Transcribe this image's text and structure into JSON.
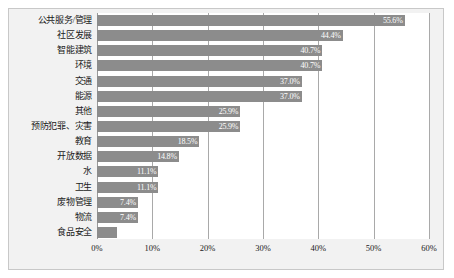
{
  "chart_data": {
    "type": "bar",
    "orientation": "horizontal",
    "title": "",
    "xlabel": "",
    "ylabel": "",
    "xlim": [
      0,
      60
    ],
    "grid": true,
    "legend": false,
    "x_ticks": [
      "0%",
      "10%",
      "20%",
      "30%",
      "40%",
      "50%",
      "60%"
    ],
    "x_tick_values": [
      0,
      10,
      20,
      30,
      40,
      50,
      60
    ],
    "categories": [
      "公共服务/管理",
      "社区发展",
      "智能建筑",
      "环境",
      "交通",
      "能源",
      "其他",
      "预防犯罪、灾害",
      "教育",
      "开放数据",
      "水",
      "卫生",
      "废物管理",
      "物流",
      "食品安全"
    ],
    "values": [
      55.6,
      44.4,
      40.7,
      40.7,
      37.0,
      37.0,
      25.9,
      25.9,
      18.5,
      14.8,
      11.1,
      11.1,
      7.4,
      7.4,
      3.7
    ],
    "value_labels": [
      "55.6%",
      "44.4%",
      "40.7%",
      "40.7%",
      "37.0%",
      "37.0%",
      "25.9%",
      "25.9%",
      "18.5%",
      "14.8%",
      "11.1%",
      "11.1%",
      "7.4%",
      "7.4%",
      ""
    ],
    "colors": {
      "bar": "#8c8c8c",
      "value_label": "#ffffff",
      "gridline": "#a9a9a9",
      "panel_background": "#f2f2f2",
      "plot_background": "#ffffff",
      "panel_border": "#c8c8c8",
      "text": "#1a1a1a"
    }
  }
}
